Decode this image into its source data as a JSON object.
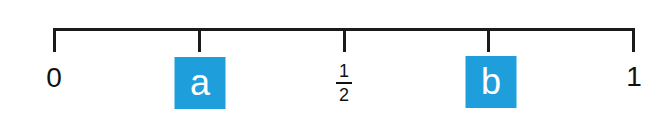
{
  "number_line": {
    "range": [
      0,
      1
    ],
    "line_color": "#1a1a1a",
    "box_color": "#1e9fdc",
    "points": [
      {
        "position": 0,
        "kind": "number",
        "label": "0"
      },
      {
        "position": 0.25,
        "kind": "variable-box",
        "label": "a"
      },
      {
        "position": 0.5,
        "kind": "fraction",
        "numerator": "1",
        "denominator": "2"
      },
      {
        "position": 0.75,
        "kind": "variable-box",
        "label": "b"
      },
      {
        "position": 1,
        "kind": "number",
        "label": "1"
      }
    ]
  }
}
